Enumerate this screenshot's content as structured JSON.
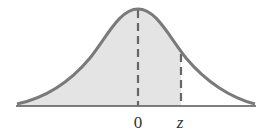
{
  "diagram": {
    "labels": {
      "zero": "0",
      "z": "z"
    },
    "colors": {
      "curve": "#7a7a7a",
      "shade": "#e4e4e4",
      "axis": "#555555",
      "dash": "#666666"
    }
  }
}
